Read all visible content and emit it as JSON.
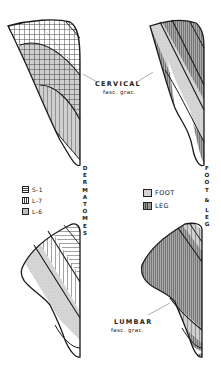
{
  "figure": {
    "panels": [
      {
        "id": "cervical-dermatomes",
        "position": "top-left",
        "label": "CERVICAL",
        "sublabel": "fasc. grac."
      },
      {
        "id": "cervical-foot-leg",
        "position": "top-right"
      },
      {
        "id": "lumbar-dermatomes",
        "position": "bottom-left",
        "label": "LUMBAR",
        "sublabel": "fasc. grac."
      },
      {
        "id": "lumbar-foot-leg",
        "position": "bottom-right"
      }
    ],
    "cervical_label": {
      "main": "CERVICAL",
      "sub": "fasc. grac."
    },
    "lumbar_label": {
      "main": "LUMBAR",
      "sub": "fasc. grac."
    },
    "vertical_labels": {
      "left": [
        "D",
        "E",
        "R",
        "M",
        "A",
        "T",
        "O",
        "M",
        "E",
        "S"
      ],
      "right": [
        "F",
        "O",
        "O",
        "T",
        "&",
        "L",
        "E",
        "G"
      ]
    },
    "legend_left": {
      "items": [
        {
          "label": "S-1",
          "pattern": "horizontal-hatch"
        },
        {
          "label": "L-7",
          "pattern": "vertical-hatch"
        },
        {
          "label": "L-6",
          "pattern": "stipple"
        }
      ]
    },
    "legend_right": {
      "items": [
        {
          "label": "FOOT",
          "pattern": "light-stipple"
        },
        {
          "label": "LEG",
          "pattern": "vertical-dense"
        }
      ]
    },
    "colors": {
      "ink": "#1a1a1a",
      "stipple": "#c8c8c8",
      "dense": "#8c8c8c",
      "paper": "#ffffff"
    }
  }
}
